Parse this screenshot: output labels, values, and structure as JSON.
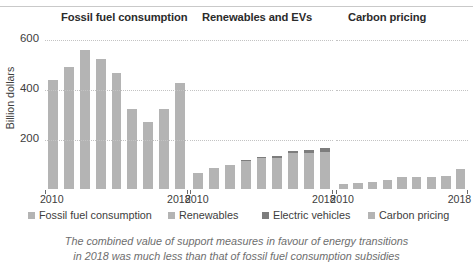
{
  "chart_data": {
    "type": "bar",
    "title": "",
    "subtitle": "",
    "xlabel": "",
    "ylabel": "Billion dollars",
    "ylim": [
      0,
      640
    ],
    "yticks": [
      200,
      400,
      600
    ],
    "grid": true,
    "legend_position": "bottom",
    "x": [
      2010,
      2011,
      2012,
      2013,
      2014,
      2015,
      2016,
      2017,
      2018
    ],
    "xtick_labels": [
      "2010",
      "2018"
    ],
    "panels": [
      {
        "title": "Fossil fuel consumption",
        "series": [
          {
            "name": "Fossil fuel consumption",
            "color": "#b4b4b4",
            "values": [
              435,
              490,
              555,
              520,
              465,
              320,
              270,
              320,
              425
            ]
          }
        ]
      },
      {
        "title": "Renewables and EVs",
        "series": [
          {
            "name": "Renewables",
            "color": "#b4b4b4",
            "values": [
              66,
              86,
              98,
              116,
              124,
              126,
              143,
              146,
              150
            ]
          },
          {
            "name": "Electric vehicles",
            "color": "#7d7d7d",
            "values": [
              0,
              0,
              0,
              2,
              3,
              5,
              8,
              12,
              16
            ]
          }
        ]
      },
      {
        "title": "Carbon pricing",
        "series": [
          {
            "name": "Carbon pricing",
            "color": "#b4b4b4",
            "values": [
              22,
              24,
              28,
              38,
              47,
              50,
              50,
              52,
              80
            ]
          }
        ]
      }
    ]
  },
  "axis": {
    "y_title": "Billion dollars",
    "ticks": [
      "600",
      "400",
      "200"
    ]
  },
  "panel_titles": {
    "p0": "Fossil fuel consumption",
    "p1": "Renewables and EVs",
    "p2": "Carbon pricing"
  },
  "xaxis": {
    "p0_start": "2010",
    "p0_end": "2018",
    "p1_start": "2010",
    "p1_end": "2018",
    "p2_start": "2010",
    "p2_end": "2018"
  },
  "legend": {
    "items": [
      {
        "label": "Fossil fuel consumption",
        "color": "#b4b4b4"
      },
      {
        "label": "Renewables",
        "color": "#b4b4b4"
      },
      {
        "label": "Electric vehicles",
        "color": "#7d7d7d"
      },
      {
        "label": "Carbon pricing",
        "color": "#b4b4b4"
      }
    ]
  },
  "caption": {
    "line1": "The combined value of support measures in favour of energy transitions",
    "line2": "in 2018 was much less than that of fossil fuel consumption subsidies"
  }
}
